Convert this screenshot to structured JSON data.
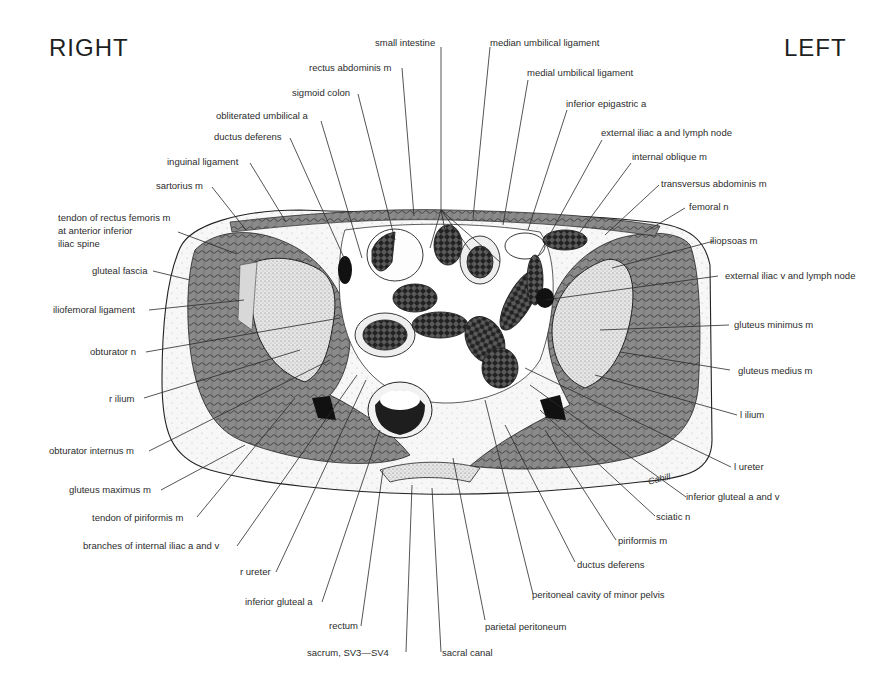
{
  "figure": {
    "orientation": {
      "right": "RIGHT",
      "left": "LEFT"
    },
    "view": "transverse section of male pelvis",
    "signature": "Cahill",
    "labels_top": [
      "small intestine",
      "median umbilical ligament",
      "rectus abdominis m",
      "medial umbilical ligament",
      "sigmoid colon",
      "obliterated umbilical a",
      "inferior epigastric a",
      "ductus deferens",
      "external iliac a and lymph node",
      "inguinal ligament",
      "internal oblique m",
      "sartorius m",
      "transversus abdominis m",
      "femoral n"
    ],
    "labels_left": [
      "tendon of rectus femoris m",
      "at anterior inferior",
      "iliac spine",
      "gluteal fascia",
      "iliofemoral ligament",
      "obturator n",
      "r ilium",
      "obturator internus m",
      "gluteus maximus m",
      "tendon of piriformis m",
      "branches of internal iliac a and v",
      "r ureter",
      "inferior gluteal a",
      "rectum",
      "sacrum, SV3—SV4"
    ],
    "labels_right": [
      "iliopsoas m",
      "external iliac v and lymph node",
      "gluteus minimus m",
      "gluteus medius m",
      "l ilium",
      "l ureter",
      "inferior gluteal a and v",
      "sciatic n",
      "piriformis m",
      "ductus deferens",
      "peritoneal cavity of minor pelvis",
      "parietal peritoneum",
      "sacral canal"
    ]
  }
}
